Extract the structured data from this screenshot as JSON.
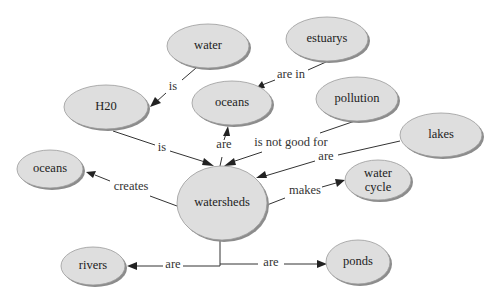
{
  "diagram": {
    "type": "concept-map",
    "nodes": [
      {
        "id": "water",
        "label": "water",
        "cx": 208,
        "cy": 46,
        "rx": 41,
        "ry": 22
      },
      {
        "id": "estuarys",
        "label": "estuarys",
        "cx": 327,
        "cy": 39,
        "rx": 41,
        "ry": 22
      },
      {
        "id": "h20",
        "label": "H20",
        "cx": 106,
        "cy": 107,
        "rx": 42,
        "ry": 22
      },
      {
        "id": "oceans_top",
        "label": "oceans",
        "cx": 232,
        "cy": 103,
        "rx": 40,
        "ry": 22
      },
      {
        "id": "pollution",
        "label": "pollution",
        "cx": 357,
        "cy": 99,
        "rx": 41,
        "ry": 22
      },
      {
        "id": "lakes",
        "label": "lakes",
        "cx": 441,
        "cy": 135,
        "rx": 41,
        "ry": 22
      },
      {
        "id": "oceans_left",
        "label": "oceans",
        "cx": 50,
        "cy": 169,
        "rx": 33,
        "ry": 19
      },
      {
        "id": "watersheds",
        "label": "watersheds",
        "cx": 222,
        "cy": 203,
        "rx": 45,
        "ry": 37
      },
      {
        "id": "water_cycle",
        "label_line1": "water",
        "label_line2": "cycle",
        "cx": 378,
        "cy": 180,
        "rx": 33,
        "ry": 20
      },
      {
        "id": "rivers",
        "label": "rivers",
        "cx": 93,
        "cy": 266,
        "rx": 32,
        "ry": 19
      },
      {
        "id": "ponds",
        "label": "ponds",
        "cx": 358,
        "cy": 262,
        "rx": 32,
        "ry": 22
      }
    ],
    "edges": [
      {
        "from": "water",
        "to": "h20",
        "label": "is"
      },
      {
        "from": "estuarys",
        "to": "oceans_top",
        "label": "are in"
      },
      {
        "from": "h20",
        "to": "watersheds",
        "label": "is"
      },
      {
        "from": "watersheds",
        "to": "oceans_top",
        "label": "are"
      },
      {
        "from": "pollution",
        "to": "watersheds",
        "label": "is not good for"
      },
      {
        "from": "lakes",
        "to": "watersheds",
        "label": "are"
      },
      {
        "from": "watersheds",
        "to": "oceans_left",
        "label": "creates"
      },
      {
        "from": "watersheds",
        "to": "water_cycle",
        "label": "makes"
      },
      {
        "from": "watersheds",
        "to": "rivers",
        "label": "are"
      },
      {
        "from": "watersheds",
        "to": "ponds",
        "label": "are"
      }
    ],
    "colors": {
      "node_fill": "#dedede",
      "node_shadow": "#8c8c8c",
      "line": "#333333",
      "background": "#ffffff"
    }
  }
}
